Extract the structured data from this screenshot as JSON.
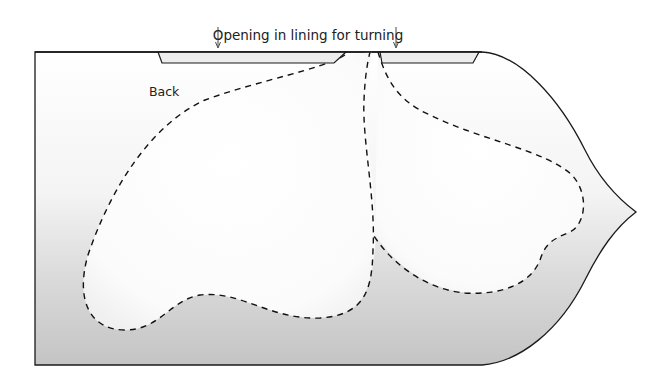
{
  "diagram": {
    "title_annotation": "Opening in lining for turning",
    "piece_label": "Back",
    "colors": {
      "outline": "#1a1a1a",
      "fill_light": "#ffffff",
      "fill_dark": "#c8c8c8",
      "lining_strip": "#ececec",
      "dash": "#111111",
      "text": "#222222"
    },
    "elements": {
      "outer_piece": "pattern piece outline (back)",
      "lining_strips": [
        "left lining strip",
        "right lining strip"
      ],
      "arrows": [
        "left arrow",
        "right arrow"
      ],
      "dashed_shapes": [
        "left lobe",
        "right lobe"
      ]
    }
  }
}
